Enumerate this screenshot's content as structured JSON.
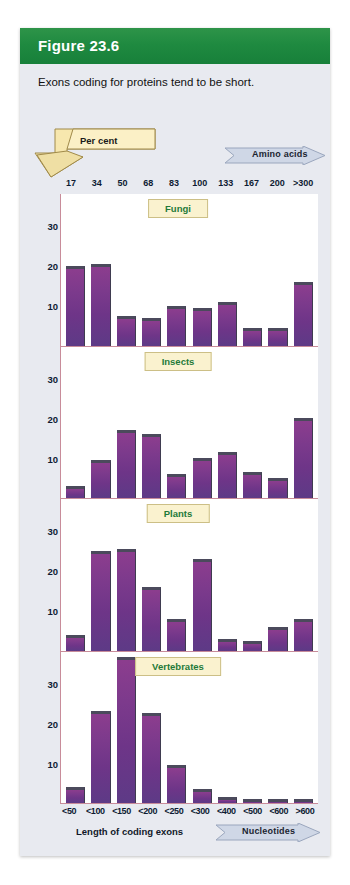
{
  "figure": {
    "number_label": "Figure 23.6",
    "caption": "Exons coding for proteins tend to be short.",
    "header_color": "#1f8a40",
    "card_bg": "#e8eaf0",
    "bar_color": "#7c3a8c",
    "panel_title_color": "#1f7a3a"
  },
  "axes": {
    "y_banner_label": "Per cent",
    "x_top_banner_label": "Amino acids",
    "x_bottom_banner_label": "Nucleotides",
    "x_bottom_axis_title": "Length of coding exons",
    "y_ticks": [
      "10",
      "20",
      "30"
    ],
    "top_tick_labels": [
      "17",
      "34",
      "50",
      "68",
      "83",
      "100",
      "133",
      "167",
      "200",
      ">300"
    ],
    "bottom_tick_labels": [
      "<50",
      "<100",
      "<150",
      "<200",
      "<250",
      "<300",
      "<400",
      "<500",
      "<600",
      ">600"
    ]
  },
  "chart_data": {
    "type": "bar",
    "title": "Exons coding for proteins tend to be short.",
    "xlabel": "Length of coding exons",
    "ylabel": "Per cent",
    "ylim": [
      0,
      38
    ],
    "grid": false,
    "legend": "none",
    "categories": [
      "<50",
      "<100",
      "<150",
      "<200",
      "<250",
      "<300",
      "<400",
      "<500",
      "<600",
      ">600"
    ],
    "categories_amino_acids": [
      "17",
      "34",
      "50",
      "68",
      "83",
      "100",
      "133",
      "167",
      "200",
      ">300"
    ],
    "panels": [
      {
        "name": "Fungi",
        "yticks": [
          10,
          20,
          30
        ],
        "values": [
          20,
          20.5,
          7.5,
          7,
          10,
          9.5,
          11,
          4.5,
          4.5,
          16
        ]
      },
      {
        "name": "Insects",
        "yticks": [
          10,
          20,
          30
        ],
        "values": [
          3,
          9.5,
          17,
          16,
          6,
          10,
          11.5,
          6.5,
          5,
          20
        ]
      },
      {
        "name": "Plants",
        "yticks": [
          10,
          20,
          30
        ],
        "values": [
          4,
          25,
          25.5,
          16,
          8,
          23,
          3,
          2.5,
          6,
          8
        ]
      },
      {
        "name": "Vertebrates",
        "yticks": [
          10,
          20,
          30
        ],
        "values": [
          4,
          23,
          36.5,
          22.5,
          9.5,
          3.5,
          1.5,
          1,
          1,
          1
        ]
      }
    ]
  }
}
